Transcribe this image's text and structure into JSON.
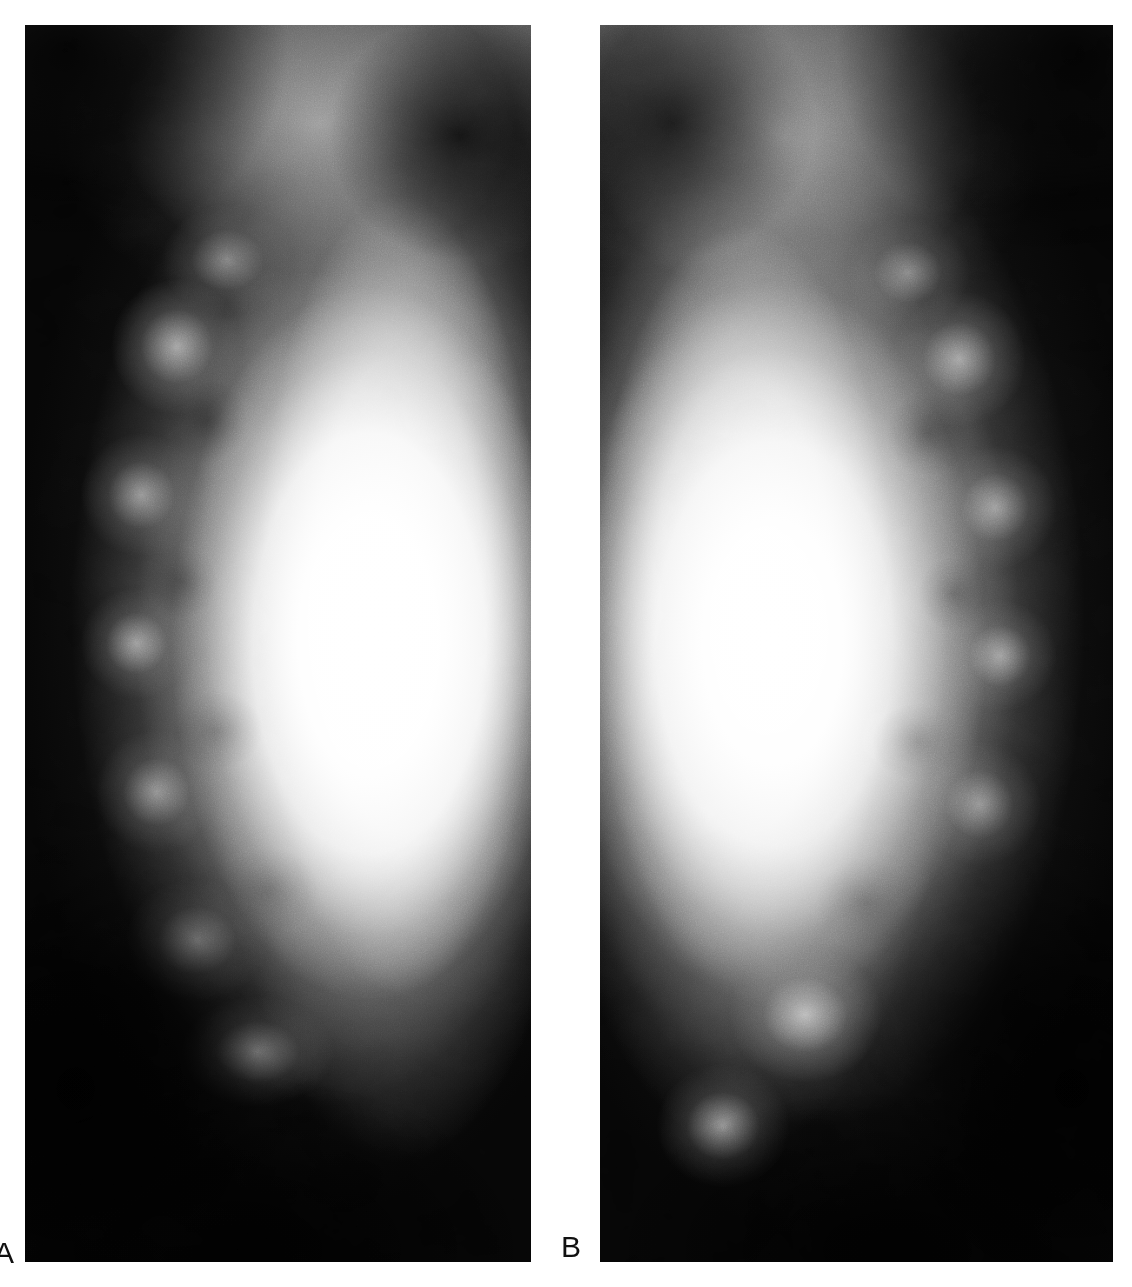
{
  "figure": {
    "kind": "two-panel-mammogram",
    "background_color": "#ffffff",
    "panels": [
      {
        "id": "A",
        "label": "A",
        "modality": "mammogram",
        "view": "craniocaudal",
        "side": "left-of-figure",
        "film_background_color": "#050505",
        "tissue_highlight_color": "#ffffff",
        "description": "Dense fibroglandular breast tissue with saturated bright central parenchyma, dark fatty periphery, and a bright diagonal pectoral/skin-fold line in the upper right."
      },
      {
        "id": "B",
        "label": "B",
        "modality": "mammogram",
        "view": "craniocaudal",
        "side": "right-of-figure",
        "film_background_color": "#050505",
        "tissue_highlight_color": "#ffffff",
        "description": "Contralateral or follow-up mammogram with mirrored anatomy: bright central dense tissue, dark fatty periphery at the right margin, and a bright diagonal pectoral line in the upper left."
      }
    ]
  },
  "labels": {
    "panel_a": "A",
    "panel_b": "B"
  }
}
